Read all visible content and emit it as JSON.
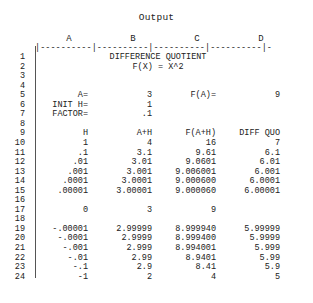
{
  "title": "Output",
  "columns": [
    "A",
    "B",
    "C",
    "D"
  ],
  "separator": "|----------|----------|----------|----------|-",
  "rows": [
    {
      "n": "1",
      "center": "DIFFERENCE QUOTIENT"
    },
    {
      "n": "2",
      "center": "F(X) = X^2"
    },
    {
      "n": "3"
    },
    {
      "n": "4"
    },
    {
      "n": "5",
      "A": "A=",
      "B": "3",
      "C": "F(A)=",
      "D": "9"
    },
    {
      "n": "6",
      "A": "INIT H=",
      "B": "1"
    },
    {
      "n": "7",
      "A": "FACTOR=",
      "B": ".1"
    },
    {
      "n": "8"
    },
    {
      "n": "9",
      "A": "H",
      "B": "A+H",
      "C": "F(A+H)",
      "D": "DIFF QUO"
    },
    {
      "n": "10",
      "A": "1",
      "B": "4",
      "C": "16",
      "D": "7"
    },
    {
      "n": "11",
      "A": ".1",
      "B": "3.1",
      "C": "9.61",
      "D": "6.1"
    },
    {
      "n": "12",
      "A": ".01",
      "B": "3.01",
      "C": "9.0601",
      "D": "6.01"
    },
    {
      "n": "13",
      "A": ".001",
      "B": "3.001",
      "C": "9.006001",
      "D": "6.001"
    },
    {
      "n": "14",
      "A": ".0001",
      "B": "3.0001",
      "C": "9.000600",
      "D": "6.0001"
    },
    {
      "n": "15",
      "A": ".00001",
      "B": "3.00001",
      "C": "9.000060",
      "D": "6.00001"
    },
    {
      "n": "16"
    },
    {
      "n": "17",
      "A": "0",
      "B": "3",
      "C": "9"
    },
    {
      "n": "18"
    },
    {
      "n": "19",
      "A": "-.00001",
      "B": "2.99999",
      "C": "8.999940",
      "D": "5.99999"
    },
    {
      "n": "20",
      "A": "-.0001",
      "B": "2.9999",
      "C": "8.999400",
      "D": "5.9999"
    },
    {
      "n": "21",
      "A": "-.001",
      "B": "2.999",
      "C": "8.994001",
      "D": "5.999"
    },
    {
      "n": "22",
      "A": "-.01",
      "B": "2.99",
      "C": "8.9401",
      "D": "5.99"
    },
    {
      "n": "23",
      "A": "-.1",
      "B": "2.9",
      "C": "8.41",
      "D": "5.9"
    },
    {
      "n": "24",
      "A": "-1",
      "B": "2",
      "C": "4",
      "D": "5"
    }
  ]
}
